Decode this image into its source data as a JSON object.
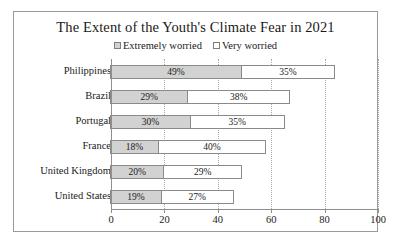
{
  "chart_data": {
    "type": "bar",
    "orientation": "horizontal",
    "stacked": true,
    "title": "The Extent of the Youth's Climate Fear in 2021",
    "xlabel": "",
    "ylabel": "",
    "xlim": [
      0,
      100
    ],
    "xticks": [
      0,
      20,
      40,
      60,
      80,
      100
    ],
    "grid": "vertical-dotted",
    "legend_position": "top-center",
    "categories": [
      "Philippines",
      "Brazil",
      "Portugal",
      "France",
      "United Kingdom",
      "United States"
    ],
    "series": [
      {
        "name": "Extremely worried",
        "color": "#d2d2d2",
        "values": [
          49,
          29,
          30,
          18,
          20,
          19
        ],
        "labels": [
          "49%",
          "29%",
          "30%",
          "18%",
          "20%",
          "19%"
        ]
      },
      {
        "name": "Very worried",
        "color": "#ffffff",
        "values": [
          35,
          38,
          35,
          40,
          29,
          27
        ],
        "labels": [
          "35%",
          "38%",
          "35%",
          "40%",
          "29%",
          "27%"
        ]
      }
    ],
    "tick_labels": [
      "0",
      "20",
      "40",
      "60",
      "80",
      "100"
    ]
  },
  "style": {
    "frame_border": "#9a9a9a",
    "axis_color": "#8f8f8f",
    "bar_border": "#8a8a8a",
    "gridline_color": "#aaaaaa",
    "text_color": "#1a1a1a",
    "background": "#ffffff"
  }
}
